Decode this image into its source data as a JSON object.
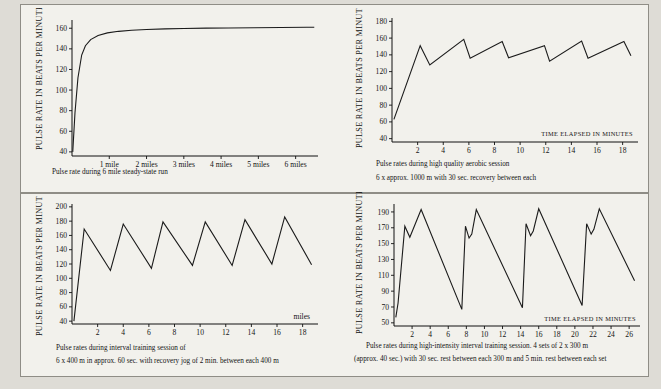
{
  "page": {
    "background": "#dedcd6",
    "sheet_background": "#f2f1ec",
    "ink": "#1b1b1b"
  },
  "chart_data": [
    {
      "id": "steady-state-run",
      "type": "line",
      "title": "",
      "caption": "Pulse rate during 6 mile steady-state run",
      "caption_line2": "",
      "ylabel": "PULSE RATE IN BEATS PER MINUTE",
      "xlabel": "",
      "ylim": [
        36,
        168
      ],
      "yticks": [
        40,
        60,
        80,
        100,
        120,
        140,
        160
      ],
      "xlim": [
        0,
        6.6
      ],
      "xticks": [
        1,
        2,
        3,
        4,
        5,
        6
      ],
      "xticklabels": [
        "1 mile",
        "2 miles",
        "3 miles",
        "4 miles",
        "5 miles",
        "6 miles"
      ],
      "grid": false,
      "legend": "none",
      "x": [
        0.02,
        0.08,
        0.16,
        0.26,
        0.36,
        0.5,
        0.7,
        0.95,
        1.25,
        1.6,
        2.0,
        2.5,
        3.0,
        3.6,
        4.2,
        4.9,
        5.6,
        6.3,
        6.5
      ],
      "y": [
        40,
        78,
        112,
        134,
        143,
        149,
        153,
        155.5,
        157,
        158,
        158.8,
        159.4,
        159.8,
        160.1,
        160.3,
        160.5,
        160.7,
        160.9,
        161
      ]
    },
    {
      "id": "high-quality-aerobic",
      "type": "line",
      "title": "",
      "caption": "Pulse rates during high quality aerobic session",
      "caption_line2": "6 x approx. 1000 m with 30 sec.  recovery between each",
      "ylabel": "PULSE RATE IN BEATS PER MINUTE",
      "xlabel": "TIME ELAPSED IN MINUTES",
      "ylim": [
        36,
        184
      ],
      "yticks": [
        40,
        60,
        80,
        100,
        120,
        140,
        160,
        180
      ],
      "xlim": [
        0,
        19.2
      ],
      "xticks": [
        2,
        4,
        6,
        8,
        10,
        12,
        14,
        16,
        18
      ],
      "xticklabels": [
        "2",
        "4",
        "6",
        "8",
        "10",
        "12",
        "14",
        "16",
        "18"
      ],
      "grid": false,
      "legend": "none",
      "x": [
        0.15,
        2.2,
        2.95,
        5.6,
        6.1,
        8.6,
        9.1,
        11.9,
        12.3,
        14.8,
        15.3,
        18.1,
        18.65
      ],
      "y": [
        63,
        151,
        128,
        158.5,
        136,
        156,
        136.5,
        151,
        132.5,
        156.5,
        136,
        156,
        139
      ]
    },
    {
      "id": "interval-training-400m",
      "type": "line",
      "title": "",
      "caption": "Pulse rates during interval training session of",
      "caption_line2": "6 x 400 m in approx. 60 sec.  with recovery jog of 2 min.  between each 400 m",
      "ylabel": "PULSE RATE IN BEATS PER MINUTE",
      "xlabel": "miles",
      "ylim": [
        36,
        204
      ],
      "yticks": [
        40,
        60,
        80,
        100,
        120,
        140,
        160,
        180,
        200
      ],
      "xlim": [
        0,
        19.2
      ],
      "xticks": [
        2,
        4,
        6,
        8,
        10,
        12,
        14,
        16,
        18
      ],
      "xticklabels": [
        "2",
        "4",
        "6",
        "8",
        "10",
        "12",
        "14",
        "16",
        "18"
      ],
      "grid": false,
      "legend": "none",
      "x": [
        0.15,
        0.95,
        3.0,
        4.0,
        6.2,
        7.1,
        9.4,
        10.4,
        12.5,
        13.5,
        15.6,
        16.6,
        18.7
      ],
      "y": [
        40,
        169,
        111,
        176,
        114,
        179,
        118,
        179,
        118,
        182,
        120,
        186,
        119
      ]
    },
    {
      "id": "high-intensity-interval",
      "type": "line",
      "title": "",
      "caption": "Pulse rates during high-intensity interval training session.  4 sets of 2 x 300 m",
      "caption_line2": "(approx. 40 sec.)  with 30 sec.  rest between each 300 m and 5 min.  rest between each set",
      "ylabel": "PULSE RATE IN BEATS PER MINUTE",
      "xlabel": "TIME ELAPSED IN MINUTES",
      "ylim": [
        46,
        200
      ],
      "yticks": [
        50,
        70,
        90,
        110,
        130,
        150,
        170,
        190
      ],
      "xlim": [
        0,
        27.2
      ],
      "xticks": [
        2,
        4,
        6,
        8,
        10,
        12,
        14,
        16,
        18,
        20,
        22,
        24,
        26
      ],
      "xticklabels": [
        "2",
        "4",
        "6",
        "8",
        "10",
        "12",
        "14",
        "16",
        "18",
        "20",
        "22",
        "24",
        "26"
      ],
      "grid": false,
      "legend": "none",
      "x": [
        0.2,
        0.45,
        1.2,
        1.75,
        3.0,
        7.5,
        7.9,
        8.3,
        8.6,
        9.1,
        14.2,
        14.6,
        15.1,
        15.4,
        16.0,
        20.8,
        21.3,
        21.8,
        22.1,
        22.7,
        26.6
      ],
      "y": [
        57,
        75,
        172,
        158,
        193,
        67,
        172,
        157,
        162,
        193,
        69,
        175,
        160,
        166,
        194,
        72,
        175,
        162,
        168,
        194,
        103
      ]
    }
  ]
}
